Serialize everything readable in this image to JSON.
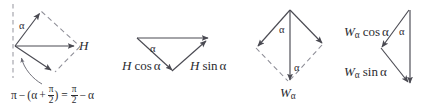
{
  "figure": {
    "background_color": "#ffffff",
    "stroke_color": "#4a4a52",
    "dashed_color": "#8d8d96",
    "text_color": "#2b2b30",
    "panel_count": 4
  },
  "panels": [
    {
      "id": "panel-h-rhombus",
      "name": "H resultant rhombus",
      "angle_label": "α",
      "resultant_label_italic": "H",
      "formula": {
        "pi_1": "π",
        "minus_1": "−",
        "open_paren": "(",
        "alpha": "α",
        "plus": "+",
        "frac1_num": "π",
        "frac1_den": "2",
        "close_paren": ")",
        "equals": "=",
        "frac2_num": "π",
        "frac2_den": "2",
        "minus_2": "−",
        "alpha_2": "α",
        "plain_text": "π − (α + π/2) = π/2 − α"
      }
    },
    {
      "id": "panel-h-components",
      "name": "H components triangle",
      "angle_label": "α",
      "left_component": {
        "vector": "H",
        "trig": "cos",
        "angle": "α",
        "plain_text": "H cos α"
      },
      "right_component": {
        "vector": "H",
        "trig": "sin",
        "angle": "α",
        "plain_text": "H sin α"
      }
    },
    {
      "id": "panel-walpha-rhombus",
      "name": "W-alpha resultant rhombus",
      "angle_label_top": "α",
      "angle_label_bottom": "α",
      "resultant": {
        "vector": "W",
        "subscript": "α",
        "plain_text": "Wα"
      }
    },
    {
      "id": "panel-walpha-components",
      "name": "W-alpha components triangle",
      "angle_label": "α",
      "cos_component": {
        "vector": "W",
        "subscript": "α",
        "trig": "cos",
        "angle": "α",
        "plain_text": "Wα cos α"
      },
      "sin_component": {
        "vector": "W",
        "subscript": "α",
        "trig": "sin",
        "angle": "α",
        "plain_text": "Wα sin α"
      }
    }
  ]
}
